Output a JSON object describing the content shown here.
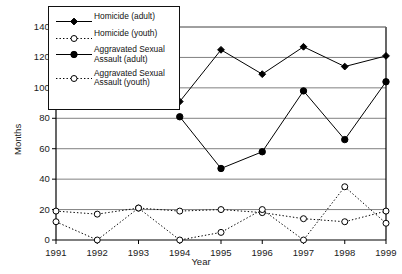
{
  "chart_data": {
    "type": "line",
    "title": "",
    "xlabel": "Year",
    "ylabel": "Months",
    "x": [
      1991,
      1992,
      1993,
      1994,
      1995,
      1996,
      1997,
      1998,
      1999
    ],
    "categories": [
      "1991",
      "1992",
      "1993",
      "1994",
      "1995",
      "1996",
      "1997",
      "1998",
      "1999"
    ],
    "xlim": [
      1991,
      1999
    ],
    "ylim": [
      0,
      140
    ],
    "yticks": [
      0,
      20,
      40,
      60,
      80,
      100,
      120,
      140
    ],
    "ytick_labels": [
      "0",
      "20",
      "40",
      "60",
      "80",
      "100",
      "120",
      "140"
    ],
    "grid": "horizontal",
    "legend_position": "top-left-inside",
    "series": [
      {
        "name": "Homicide (adult)",
        "marker": "filled-diamond",
        "line": "solid",
        "color": "#000000",
        "x": [
          1994,
          1995,
          1996,
          1997,
          1998,
          1999
        ],
        "values": [
          91,
          125,
          109,
          127,
          114,
          121
        ]
      },
      {
        "name": "Homicide (youth)",
        "marker": "open-circle",
        "line": "dotted",
        "color": "#000000",
        "x": [
          1991,
          1992,
          1993,
          1994,
          1995,
          1996,
          1997,
          1998,
          1999
        ],
        "values": [
          19,
          17,
          21,
          19,
          20,
          18,
          14,
          12,
          19
        ]
      },
      {
        "name": "Aggravated Sexual\nAssault (adult)",
        "marker": "filled-circle",
        "line": "solid",
        "color": "#000000",
        "x": [
          1994,
          1995,
          1996,
          1997,
          1998,
          1999
        ],
        "values": [
          81,
          47,
          58,
          98,
          66,
          104
        ]
      },
      {
        "name": "Aggravated Sexual\nAssault (youth)",
        "marker": "open-circle",
        "line": "dotted",
        "color": "#000000",
        "x": [
          1991,
          1992,
          1993,
          1994,
          1995,
          1996,
          1997,
          1998,
          1999
        ],
        "values": [
          12,
          0,
          21,
          0,
          5,
          20,
          0,
          35,
          11
        ]
      }
    ]
  },
  "legend": {
    "items": [
      {
        "label": "Homicide (adult)",
        "marker": "filled-diamond",
        "line": "solid"
      },
      {
        "label": "Homicide (youth)",
        "marker": "open-circle",
        "line": "dotted"
      },
      {
        "label": "Aggravated Sexual\nAssault (adult)",
        "marker": "filled-circle",
        "line": "solid"
      },
      {
        "label": "Aggravated Sexual\nAssault (youth)",
        "marker": "open-circle",
        "line": "dotted"
      }
    ]
  },
  "colors": {
    "axis": "#000000",
    "grid": "#808080",
    "series": "#000000",
    "background": "#ffffff"
  }
}
